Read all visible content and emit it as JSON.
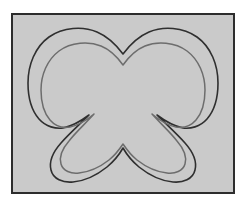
{
  "figure": {
    "frame": {
      "x": 11,
      "y": 13,
      "width": 224,
      "height": 181,
      "border_width": 2,
      "border_color": "#2d2d2d",
      "fill_color": "#cacaca"
    },
    "canvas": {
      "width": 245,
      "height": 204,
      "background_color": "#ffffff"
    },
    "contours": [
      {
        "name": "outer-contour",
        "stroke_color": "#2f2f2f",
        "stroke_width": 1.6,
        "closed": true
      },
      {
        "name": "inner-contour",
        "stroke_color": "#6d6d6d",
        "stroke_width": 1.5,
        "closed": true,
        "offset_px": 7
      }
    ],
    "geometry": {
      "center_x": 111,
      "top_notch_y": 38,
      "upper_v_y": 79,
      "lower_v_y": 110,
      "bottom_bump_y": 155,
      "left_extent_x": 15,
      "right_extent_x": 207,
      "bottom_extent_y": 168,
      "top_extent_y": 16
    }
  }
}
